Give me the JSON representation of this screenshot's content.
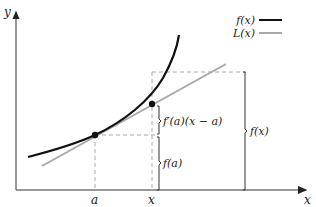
{
  "diagram": {
    "type": "linear-approximation",
    "axes": {
      "x_label": "x",
      "y_label": "y"
    },
    "legend": [
      {
        "label": "f(x)",
        "color": "#111111",
        "style": "solid-thick"
      },
      {
        "label": "L(x)",
        "color": "#a8a8a8",
        "style": "solid"
      }
    ],
    "ticks": {
      "a_label": "a",
      "x_label": "x"
    },
    "braces": {
      "increment_label": "f′(a)(x − a)",
      "fa_label": "f(a)",
      "fx_label": "f(x)"
    },
    "colors": {
      "curve": "#111111",
      "tangent": "#a8a8a8",
      "axes": "#555555",
      "dashed": "#aaaaaa",
      "braces": "#333333"
    }
  }
}
